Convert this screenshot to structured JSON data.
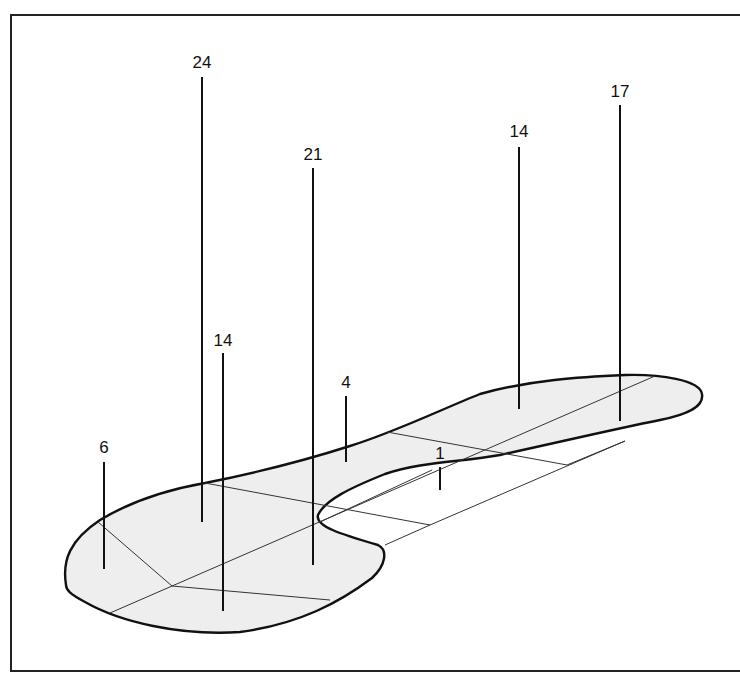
{
  "diagram": {
    "type": "perspective-foot-pressure-diagram",
    "colors": {
      "outline": "#111111",
      "fill": "#eeeeee",
      "region_lines": "#333333",
      "frame": "#222222",
      "background": "#ffffff"
    },
    "markers": [
      {
        "id": "heel-medial",
        "label": "6",
        "x": 104,
        "label_y": 453,
        "top": 462,
        "bottom": 569
      },
      {
        "id": "heel-center-top",
        "label": "24",
        "x": 202,
        "label_y": 68,
        "top": 77,
        "bottom": 522
      },
      {
        "id": "heel-lateral",
        "label": "14",
        "x": 223,
        "label_y": 346,
        "top": 353,
        "bottom": 611
      },
      {
        "id": "midfoot-lateral",
        "label": "4",
        "x": 346,
        "label_y": 388,
        "top": 396,
        "bottom": 462
      },
      {
        "id": "midfoot-center",
        "label": "21",
        "x": 313,
        "label_y": 160,
        "top": 168,
        "bottom": 565
      },
      {
        "id": "arch",
        "label": "1",
        "x": 440,
        "label_y": 459,
        "top": 467,
        "bottom": 490
      },
      {
        "id": "forefoot-lateral",
        "label": "14",
        "x": 519,
        "label_y": 137,
        "top": 147,
        "bottom": 409
      },
      {
        "id": "forefoot-medial",
        "label": "17",
        "x": 620,
        "label_y": 97,
        "top": 105,
        "bottom": 421
      }
    ]
  }
}
